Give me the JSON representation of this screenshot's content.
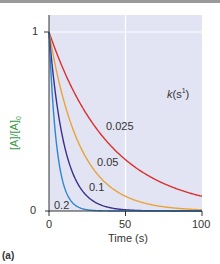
{
  "chart_data": {
    "type": "line",
    "title": "",
    "xlabel": "Time (s)",
    "ylabel": "[A]/[A]0",
    "xlim": [
      0,
      100
    ],
    "ylim": [
      0,
      1
    ],
    "xticks": [
      "0",
      "50",
      "100"
    ],
    "yticks": [
      "0",
      "1"
    ],
    "grid": true,
    "legend_title": "k(s⁻¹)",
    "annotations": [
      "0.025",
      "0.05",
      "0.1",
      "0.2"
    ],
    "panel_label": "(a)",
    "series": [
      {
        "name": "0.025",
        "k": 0.025,
        "color": "#d9302c",
        "function": "exp(-0.025 t)"
      },
      {
        "name": "0.05",
        "k": 0.05,
        "color": "#e8a33a",
        "function": "exp(-0.05 t)"
      },
      {
        "name": "0.1",
        "k": 0.1,
        "color": "#3b2f8c",
        "function": "exp(-0.1 t)"
      },
      {
        "name": "0.2",
        "k": 0.2,
        "color": "#2e86d1",
        "function": "exp(-0.2 t)"
      }
    ]
  },
  "labels": {
    "y_one": "1",
    "y_zero": "0",
    "x_zero": "0",
    "x_fifty": "50",
    "x_hundred": "100",
    "xlabel": "Time (s)",
    "ylabel": "[A]/[A]",
    "ylabel_sub": "0",
    "k_label": "k",
    "k_unit": "(s",
    "k_exp": "1",
    "k_close": ")",
    "c1": "0.025",
    "c2": "0.05",
    "c3": "0.1",
    "c4": "0.2",
    "panel": "(a)"
  }
}
